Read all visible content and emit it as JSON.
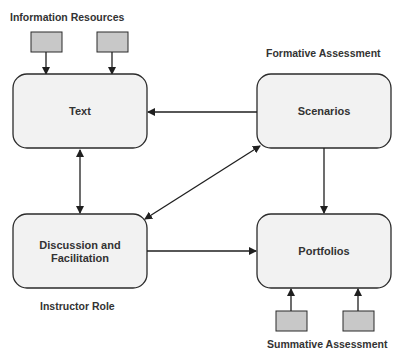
{
  "diagram": {
    "colors": {
      "box_fill": "#f2f2f2",
      "box_stroke": "#2b2b2b",
      "source_fill": "#c8c8c8",
      "line": "#1f1f1f",
      "text": "#333333"
    },
    "labels": {
      "information_resources": "Information Resources",
      "formative_assessment": "Formative  Assessment",
      "instructor_role": "Instructor Role",
      "summative_assessment": "Summative  Assessment"
    },
    "nodes": {
      "text": {
        "label": "Text"
      },
      "scenarios": {
        "label": "Scenarios"
      },
      "discussion": {
        "line1": "Discussion and",
        "line2": "Facilitation"
      },
      "portfolios": {
        "label": "Portfolios"
      }
    },
    "edges": [
      {
        "from": "information-resource-1",
        "to": "text",
        "type": "arrow"
      },
      {
        "from": "information-resource-2",
        "to": "text",
        "type": "arrow"
      },
      {
        "from": "scenarios",
        "to": "text",
        "type": "arrow"
      },
      {
        "from": "text",
        "to": "discussion",
        "type": "bidirectional"
      },
      {
        "from": "scenarios",
        "to": "discussion",
        "type": "bidirectional"
      },
      {
        "from": "scenarios",
        "to": "portfolios",
        "type": "arrow"
      },
      {
        "from": "discussion",
        "to": "portfolios",
        "type": "arrow"
      },
      {
        "from": "summative-source-1",
        "to": "portfolios",
        "type": "arrow"
      },
      {
        "from": "summative-source-2",
        "to": "portfolios",
        "type": "arrow"
      }
    ]
  }
}
